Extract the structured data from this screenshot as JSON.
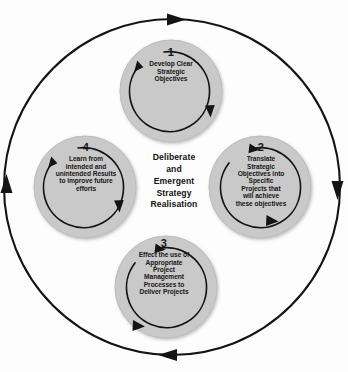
{
  "diagram": {
    "title": "Deliberate and Emergent Strategy Realisation",
    "type": "cycle-diagram",
    "colors": {
      "background": "#fdfdfd",
      "node_fill": "#c9c9c9",
      "node_stroke": "#b4b4b4",
      "line": "#111111",
      "text": "#161616"
    },
    "center": {
      "lines": [
        "Deliberate",
        "and",
        "Emergent",
        "Strategy",
        "Realisation"
      ]
    },
    "outer_ring": {
      "direction": "clockwise",
      "arrowheads": [
        "top-right",
        "right-down",
        "bottom-left",
        "left-up"
      ]
    },
    "nodes": [
      {
        "number": "1",
        "position": "top",
        "inner_arrow_direction": "clockwise",
        "lines": [
          "Develop Clear",
          "Strategic",
          "Objectives"
        ]
      },
      {
        "number": "2",
        "position": "right",
        "inner_arrow_direction": "clockwise",
        "lines": [
          "Translate",
          "Strategic",
          "Objectives into",
          "Specific",
          "Projects that",
          "will achieve",
          "these objectives"
        ]
      },
      {
        "number": "3",
        "position": "bottom",
        "inner_arrow_direction": "clockwise",
        "lines": [
          "Effect the use of",
          "Appropriate",
          "Project",
          "Management",
          "Processes to",
          "Deliver Projects"
        ]
      },
      {
        "number": "4",
        "position": "left",
        "inner_arrow_direction": "clockwise",
        "lines": [
          "Learn from",
          "intended and",
          "unintended Results",
          "to improve future",
          "efforts"
        ]
      }
    ]
  }
}
